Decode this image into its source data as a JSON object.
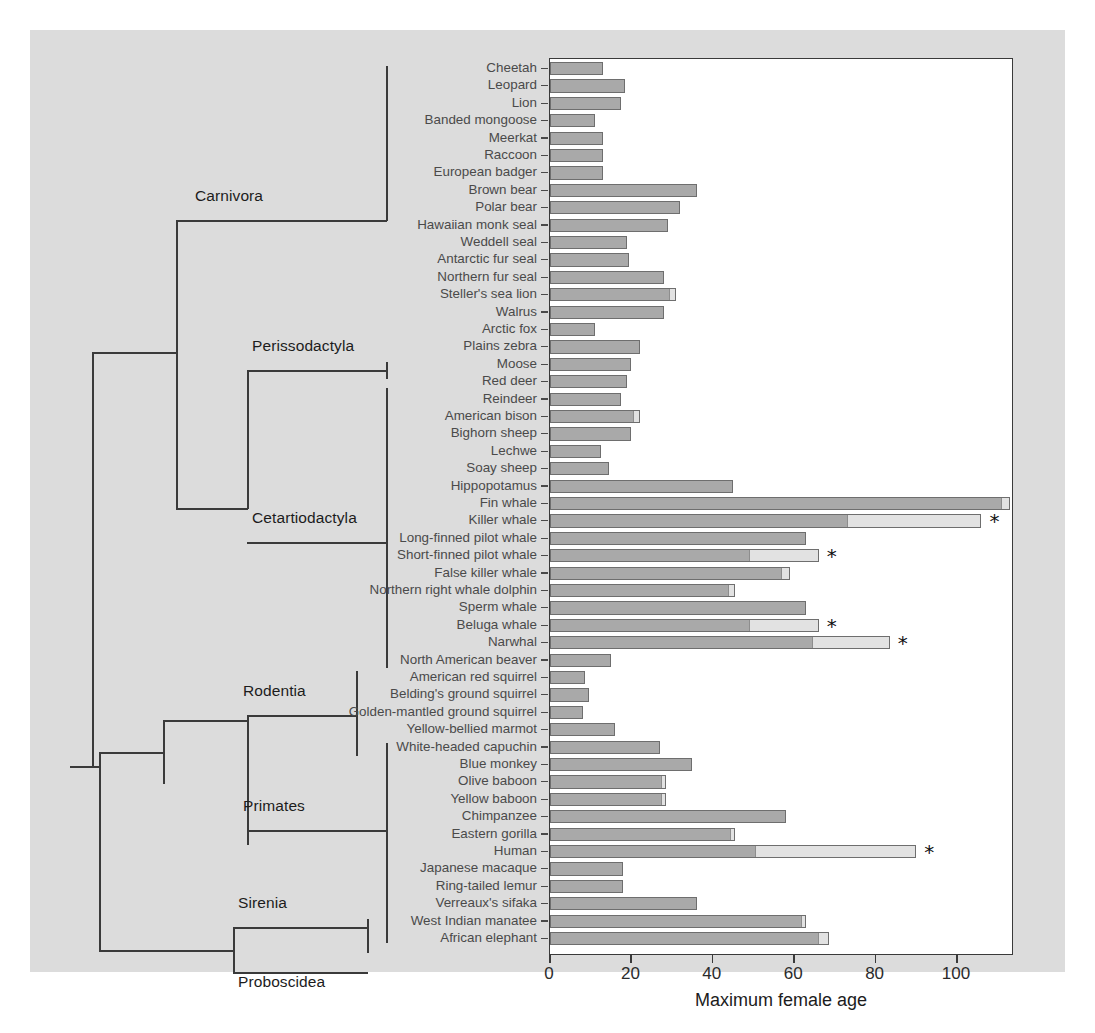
{
  "figure": {
    "background_color": "#dcdcdc",
    "plot_background": "#ffffff",
    "bar_pre_color": "#a9a9a9",
    "bar_post_color": "#e2e2e2",
    "line_color": "#3a3a3a",
    "label_color": "#4a4a4a"
  },
  "axis": {
    "xlabel": "Maximum female age",
    "ticks": [
      {
        "value": 0,
        "label": "0"
      },
      {
        "value": 20,
        "label": "20"
      },
      {
        "value": 40,
        "label": "40"
      },
      {
        "value": 60,
        "label": "60"
      },
      {
        "value": 80,
        "label": "80"
      },
      {
        "value": 100,
        "label": "100"
      }
    ],
    "xlim": [
      0,
      114
    ]
  },
  "clades": [
    {
      "name": "Carnivora",
      "label": "Carnivora"
    },
    {
      "name": "Perissodactyla",
      "label": "Perissodactyla"
    },
    {
      "name": "Cetartiodactyla",
      "label": "Cetartiodactyla"
    },
    {
      "name": "Rodentia",
      "label": "Rodentia"
    },
    {
      "name": "Primates",
      "label": "Primates"
    },
    {
      "name": "Sirenia",
      "label": "Sirenia"
    },
    {
      "name": "Proboscidea",
      "label": "Proboscidea"
    }
  ],
  "chart_data": {
    "type": "bar",
    "orientation": "horizontal",
    "stacked": true,
    "title": "",
    "xlabel": "Maximum female age",
    "ylabel": "",
    "xlim": [
      0,
      114
    ],
    "grid": false,
    "legend": [],
    "series": [
      {
        "name": "reproductive lifespan",
        "color": "#a9a9a9"
      },
      {
        "name": "post-reproductive lifespan",
        "color": "#e2e2e2"
      }
    ],
    "annotation_marker": "*",
    "annotation_meaning": "significant post-reproductive lifespan",
    "categories": [
      "Cheetah",
      "Leopard",
      "Lion",
      "Banded mongoose",
      "Meerkat",
      "Raccoon",
      "European badger",
      "Brown bear",
      "Polar bear",
      "Hawaiian monk seal",
      "Weddell seal",
      "Antarctic fur seal",
      "Northern fur seal",
      "Steller's sea lion",
      "Walrus",
      "Arctic fox",
      "Plains zebra",
      "Moose",
      "Red deer",
      "Reindeer",
      "American bison",
      "Bighorn sheep",
      "Lechwe",
      "Soay sheep",
      "Hippopotamus",
      "Fin whale",
      "Killer whale",
      "Long-finned pilot whale",
      "Short-finned pilot whale",
      "False killer whale",
      "Northern right whale dolphin",
      "Sperm whale",
      "Beluga whale",
      "Narwhal",
      "North American beaver",
      "American red squirrel",
      "Belding's ground squirrel",
      "Golden-mantled ground squirrel",
      "Yellow-bellied marmot",
      "White-headed capuchin",
      "Blue monkey",
      "Olive baboon",
      "Yellow baboon",
      "Chimpanzee",
      "Eastern gorilla",
      "Human",
      "Japanese macaque",
      "Ring-tailed lemur",
      "Verreaux's sifaka",
      "West Indian manatee",
      "African elephant"
    ],
    "rows": [
      {
        "species": "Cheetah",
        "pre": 13.0,
        "post": 13.0,
        "star": false
      },
      {
        "species": "Leopard",
        "pre": 18.5,
        "post": 18.5,
        "star": false
      },
      {
        "species": "Lion",
        "pre": 17.5,
        "post": 17.5,
        "star": false
      },
      {
        "species": "Banded mongoose",
        "pre": 11.0,
        "post": 11.0,
        "star": false
      },
      {
        "species": "Meerkat",
        "pre": 13.0,
        "post": 13.0,
        "star": false
      },
      {
        "species": "Raccoon",
        "pre": 13.0,
        "post": 13.0,
        "star": false
      },
      {
        "species": "European badger",
        "pre": 13.0,
        "post": 13.0,
        "star": false
      },
      {
        "species": "Brown bear",
        "pre": 36.0,
        "post": 36.0,
        "star": false
      },
      {
        "species": "Polar bear",
        "pre": 32.0,
        "post": 32.0,
        "star": false
      },
      {
        "species": "Hawaiian monk seal",
        "pre": 29.0,
        "post": 29.0,
        "star": false
      },
      {
        "species": "Weddell seal",
        "pre": 19.0,
        "post": 19.0,
        "star": false
      },
      {
        "species": "Antarctic fur seal",
        "pre": 19.5,
        "post": 19.5,
        "star": false
      },
      {
        "species": "Northern fur seal",
        "pre": 28.0,
        "post": 28.0,
        "star": false
      },
      {
        "species": "Steller's sea lion",
        "pre": 29.5,
        "post": 31.0,
        "star": false
      },
      {
        "species": "Walrus",
        "pre": 28.0,
        "post": 28.0,
        "star": false
      },
      {
        "species": "Arctic fox",
        "pre": 11.0,
        "post": 11.0,
        "star": false
      },
      {
        "species": "Plains zebra",
        "pre": 22.0,
        "post": 22.0,
        "star": false
      },
      {
        "species": "Moose",
        "pre": 20.0,
        "post": 20.0,
        "star": false
      },
      {
        "species": "Red deer",
        "pre": 19.0,
        "post": 19.0,
        "star": false
      },
      {
        "species": "Reindeer",
        "pre": 17.5,
        "post": 17.5,
        "star": false
      },
      {
        "species": "American bison",
        "pre": 20.5,
        "post": 22.0,
        "star": false
      },
      {
        "species": "Bighorn sheep",
        "pre": 20.0,
        "post": 20.0,
        "star": false
      },
      {
        "species": "Lechwe",
        "pre": 12.5,
        "post": 12.5,
        "star": false
      },
      {
        "species": "Soay sheep",
        "pre": 14.5,
        "post": 14.5,
        "star": false
      },
      {
        "species": "Hippopotamus",
        "pre": 45.0,
        "post": 45.0,
        "star": false
      },
      {
        "species": "Fin whale",
        "pre": 111.0,
        "post": 113.0,
        "star": false
      },
      {
        "species": "Killer whale",
        "pre": 73.0,
        "post": 106.0,
        "star": true
      },
      {
        "species": "Long-finned pilot whale",
        "pre": 63.0,
        "post": 63.0,
        "star": false
      },
      {
        "species": "Short-finned pilot whale",
        "pre": 49.0,
        "post": 66.0,
        "star": true
      },
      {
        "species": "False killer whale",
        "pre": 57.0,
        "post": 59.0,
        "star": false
      },
      {
        "species": "Northern right whale dolphin",
        "pre": 44.0,
        "post": 45.5,
        "star": false
      },
      {
        "species": "Sperm whale",
        "pre": 63.0,
        "post": 63.0,
        "star": false
      },
      {
        "species": "Beluga whale",
        "pre": 49.0,
        "post": 66.0,
        "star": true
      },
      {
        "species": "Narwhal",
        "pre": 64.5,
        "post": 83.5,
        "star": true
      },
      {
        "species": "North American beaver",
        "pre": 15.0,
        "post": 15.0,
        "star": false
      },
      {
        "species": "American red squirrel",
        "pre": 8.5,
        "post": 8.5,
        "star": false
      },
      {
        "species": "Belding's ground squirrel",
        "pre": 9.5,
        "post": 9.5,
        "star": false
      },
      {
        "species": "Golden-mantled ground squirrel",
        "pre": 8.0,
        "post": 8.0,
        "star": false
      },
      {
        "species": "Yellow-bellied marmot",
        "pre": 16.0,
        "post": 16.0,
        "star": false
      },
      {
        "species": "White-headed capuchin",
        "pre": 27.0,
        "post": 27.0,
        "star": false
      },
      {
        "species": "Blue monkey",
        "pre": 35.0,
        "post": 35.0,
        "star": false
      },
      {
        "species": "Olive baboon",
        "pre": 27.5,
        "post": 28.5,
        "star": false
      },
      {
        "species": "Yellow baboon",
        "pre": 27.5,
        "post": 28.5,
        "star": false
      },
      {
        "species": "Chimpanzee",
        "pre": 58.0,
        "post": 58.0,
        "star": false
      },
      {
        "species": "Eastern gorilla",
        "pre": 44.5,
        "post": 45.5,
        "star": false
      },
      {
        "species": "Human",
        "pre": 50.5,
        "post": 90.0,
        "star": true
      },
      {
        "species": "Japanese macaque",
        "pre": 18.0,
        "post": 18.0,
        "star": false
      },
      {
        "species": "Ring-tailed lemur",
        "pre": 18.0,
        "post": 18.0,
        "star": false
      },
      {
        "species": "Verreaux's sifaka",
        "pre": 36.0,
        "post": 36.0,
        "star": false
      },
      {
        "species": "West Indian manatee",
        "pre": 62.0,
        "post": 63.0,
        "star": false
      },
      {
        "species": "African elephant",
        "pre": 66.0,
        "post": 68.5,
        "star": false
      }
    ]
  }
}
